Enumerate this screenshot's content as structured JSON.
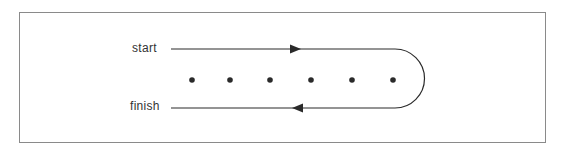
{
  "diagram": {
    "labels": {
      "start": "start",
      "finish": "finish"
    },
    "dots_count": 6,
    "colors": {
      "stroke": "#2a2a2a",
      "border": "#8a8a8a",
      "text": "#333333"
    }
  }
}
